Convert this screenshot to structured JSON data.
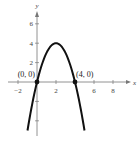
{
  "chart_data": {
    "type": "line",
    "title": "",
    "xlabel": "x",
    "ylabel": "y",
    "function": "y = -x^2 + 4x",
    "xlim": [
      -3,
      9
    ],
    "ylim": [
      -5.5,
      7.5
    ],
    "x_ticks": [
      -2,
      2,
      4,
      6,
      8
    ],
    "x_tick_labels": [
      "-2",
      "2",
      "6",
      "8"
    ],
    "y_ticks": [
      -4,
      -2,
      2,
      4,
      6
    ],
    "y_tick_labels": [
      "2",
      "4",
      "6"
    ],
    "grid": false,
    "series": [
      {
        "name": "parabola",
        "x": [
          -1,
          0,
          1,
          2,
          3,
          4,
          5
        ],
        "y": [
          -5,
          0,
          3,
          4,
          3,
          0,
          -5
        ]
      }
    ],
    "points": [
      {
        "x": 0,
        "y": 0,
        "label": "(0, 0)"
      },
      {
        "x": 4,
        "y": 0,
        "label": "(4, 0)"
      }
    ],
    "color": "#111111"
  }
}
